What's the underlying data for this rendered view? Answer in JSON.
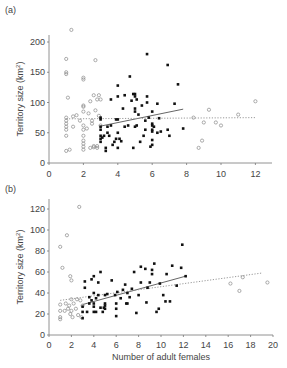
{
  "chart_data": [
    {
      "type": "scatter",
      "panel_label": "(a)",
      "title": "",
      "xlabel": "",
      "ylabel": "Territory size (km²)",
      "xlim": [
        0,
        13
      ],
      "ylim": [
        0,
        230
      ],
      "xticks": [
        0,
        2,
        4,
        6,
        8,
        10,
        12
      ],
      "yticks": [
        0,
        50,
        100,
        150,
        200
      ],
      "grid": false,
      "series": [
        {
          "name": "open circles",
          "marker": "open-circle",
          "points": [
            [
              1,
              20
            ],
            [
              1,
              45
            ],
            [
              1,
              55
            ],
            [
              1,
              60
            ],
            [
              1,
              65
            ],
            [
              1,
              70
            ],
            [
              1,
              75
            ],
            [
              1,
              147
            ],
            [
              1,
              150
            ],
            [
              1,
              172
            ],
            [
              1.1,
              108
            ],
            [
              1.2,
              22
            ],
            [
              1.3,
              220
            ],
            [
              1.4,
              60
            ],
            [
              1.4,
              77
            ],
            [
              1.6,
              79
            ],
            [
              1.8,
              70
            ],
            [
              2,
              22
            ],
            [
              2,
              27
            ],
            [
              2,
              32
            ],
            [
              2,
              37
            ],
            [
              2,
              45
            ],
            [
              2,
              55
            ],
            [
              2,
              62
            ],
            [
              2,
              85
            ],
            [
              2,
              93
            ],
            [
              2,
              95
            ],
            [
              2,
              138
            ],
            [
              2,
              141
            ],
            [
              2.2,
              57
            ],
            [
              2.3,
              82
            ],
            [
              2.4,
              25
            ],
            [
              2.4,
              102
            ],
            [
              2.5,
              65
            ],
            [
              2.5,
              70
            ],
            [
              2.6,
              26
            ],
            [
              2.6,
              28
            ],
            [
              2.6,
              112
            ],
            [
              2.7,
              87
            ],
            [
              2.7,
              170
            ],
            [
              2.8,
              25
            ],
            [
              2.8,
              28
            ],
            [
              2.8,
              105
            ],
            [
              2.9,
              78
            ],
            [
              2.9,
              112
            ],
            [
              3,
              62
            ],
            [
              3,
              105
            ],
            [
              8.4,
              75
            ],
            [
              8.7,
              25
            ],
            [
              8.9,
              37
            ],
            [
              9,
              67
            ],
            [
              9.3,
              88
            ],
            [
              9.7,
              67
            ],
            [
              10,
              62
            ],
            [
              11,
              80
            ],
            [
              12,
              102
            ]
          ]
        },
        {
          "name": "filled circles",
          "marker": "filled-circle",
          "points": [
            [
              3,
              35
            ],
            [
              3,
              40
            ],
            [
              3,
              45
            ],
            [
              3,
              55
            ],
            [
              3,
              60
            ],
            [
              3,
              72
            ],
            [
              3,
              75
            ],
            [
              3.1,
              42
            ],
            [
              3.2,
              45
            ],
            [
              3.3,
              20
            ],
            [
              3.3,
              25
            ],
            [
              3.4,
              50
            ],
            [
              3.4,
              60
            ],
            [
              3.5,
              45
            ],
            [
              3.6,
              105
            ],
            [
              3.6,
              62
            ],
            [
              3.7,
              30
            ],
            [
              3.8,
              35
            ],
            [
              3.9,
              40
            ],
            [
              3.9,
              72
            ],
            [
              4,
              25
            ],
            [
              4,
              110
            ],
            [
              4,
              128
            ],
            [
              4,
              72
            ],
            [
              4,
              50
            ],
            [
              4.1,
              40
            ],
            [
              4.2,
              36
            ],
            [
              4.3,
              90
            ],
            [
              4.4,
              60
            ],
            [
              4.4,
              112
            ],
            [
              4.6,
              62
            ],
            [
              4.7,
              143
            ],
            [
              4.8,
              103
            ],
            [
              4.9,
              25
            ],
            [
              4.9,
              114
            ],
            [
              5,
              60
            ],
            [
              5,
              85
            ],
            [
              5,
              90
            ],
            [
              5,
              110
            ],
            [
              5,
              114
            ],
            [
              5.1,
              62
            ],
            [
              5.1,
              105
            ],
            [
              5.2,
              80
            ],
            [
              5.3,
              35
            ],
            [
              5.4,
              95
            ],
            [
              5.5,
              45
            ],
            [
              5.6,
              70
            ],
            [
              5.6,
              55
            ],
            [
              5.7,
              180
            ],
            [
              5.7,
              100
            ],
            [
              5.7,
              110
            ],
            [
              5.8,
              75
            ],
            [
              5.9,
              27
            ],
            [
              6,
              30
            ],
            [
              6,
              38
            ],
            [
              6,
              52
            ],
            [
              6,
              55
            ],
            [
              6,
              62
            ],
            [
              6,
              65
            ],
            [
              6,
              85
            ],
            [
              6.1,
              60
            ],
            [
              6.3,
              98
            ],
            [
              6.3,
              50
            ],
            [
              6.4,
              74
            ],
            [
              6.5,
              52
            ],
            [
              6.9,
              162
            ],
            [
              6.9,
              55
            ],
            [
              7,
              45
            ],
            [
              7.3,
              98
            ],
            [
              7.5,
              130
            ],
            [
              7.8,
              57
            ]
          ]
        }
      ],
      "fit_lines": [
        {
          "name": "filled fit",
          "style": "solid",
          "x": [
            3,
            7.8
          ],
          "y": [
            61,
            89
          ]
        },
        {
          "name": "open fit",
          "style": "dotted",
          "x": [
            1,
            12
          ],
          "y": [
            73,
            75
          ]
        }
      ]
    },
    {
      "type": "scatter",
      "panel_label": "(b)",
      "title": "",
      "xlabel": "Number of adult females",
      "ylabel": "Territory size (km²)",
      "xlim": [
        0,
        20
      ],
      "ylim": [
        0,
        130
      ],
      "xticks": [
        0,
        2,
        4,
        6,
        8,
        10,
        12,
        14,
        16,
        18,
        20
      ],
      "yticks": [
        0,
        20,
        40,
        60,
        80,
        100,
        120
      ],
      "grid": false,
      "series": [
        {
          "name": "open circles",
          "marker": "open-circle",
          "points": [
            [
              1,
              15
            ],
            [
              1,
              17
            ],
            [
              1,
              23
            ],
            [
              1,
              29
            ],
            [
              1,
              84
            ],
            [
              1.2,
              64
            ],
            [
              1.4,
              23
            ],
            [
              1.5,
              30
            ],
            [
              1.6,
              95
            ],
            [
              1.7,
              25
            ],
            [
              1.8,
              28
            ],
            [
              1.9,
              20
            ],
            [
              1.9,
              56
            ],
            [
              2,
              34
            ],
            [
              2,
              52
            ],
            [
              2,
              23
            ],
            [
              2.1,
              17
            ],
            [
              2.2,
              30
            ],
            [
              2.4,
              25
            ],
            [
              2.5,
              34
            ],
            [
              2.6,
              19
            ],
            [
              2.7,
              122
            ],
            [
              2.8,
              33
            ],
            [
              2.9,
              17
            ],
            [
              3,
              28
            ],
            [
              16.2,
              49
            ],
            [
              17,
              42
            ],
            [
              17.3,
              55
            ],
            [
              19.5,
              50
            ]
          ]
        },
        {
          "name": "filled circles",
          "marker": "filled-circle",
          "points": [
            [
              3,
              16
            ],
            [
              3,
              22
            ],
            [
              3,
              27
            ],
            [
              3.2,
              45
            ],
            [
              3.2,
              51
            ],
            [
              3.4,
              22
            ],
            [
              3.6,
              30
            ],
            [
              3.6,
              36
            ],
            [
              3.8,
              53
            ],
            [
              3.8,
              33
            ],
            [
              4,
              22
            ],
            [
              4,
              27
            ],
            [
              4,
              30
            ],
            [
              4,
              40
            ],
            [
              4,
              56
            ],
            [
              4.2,
              22
            ],
            [
              4.2,
              35
            ],
            [
              4.4,
              38
            ],
            [
              4.4,
              50
            ],
            [
              4.6,
              26
            ],
            [
              4.6,
              60
            ],
            [
              4.8,
              22
            ],
            [
              4.9,
              26
            ],
            [
              5,
              25
            ],
            [
              5,
              28
            ],
            [
              5,
              30
            ],
            [
              5,
              38
            ],
            [
              5.2,
              39
            ],
            [
              5.6,
              52
            ],
            [
              5.9,
              38
            ],
            [
              6,
              18
            ],
            [
              6,
              25
            ],
            [
              6,
              30
            ],
            [
              6.1,
              41
            ],
            [
              6.4,
              35
            ],
            [
              6.6,
              43
            ],
            [
              6.8,
              48
            ],
            [
              6.9,
              30
            ],
            [
              7,
              30
            ],
            [
              7,
              40
            ],
            [
              7.2,
              36
            ],
            [
              7.4,
              44
            ],
            [
              7.6,
              60
            ],
            [
              7.8,
              21
            ],
            [
              8,
              38
            ],
            [
              8.2,
              50
            ],
            [
              8.2,
              65
            ],
            [
              8.6,
              63
            ],
            [
              8.7,
              31
            ],
            [
              8.8,
              45
            ],
            [
              9,
              50
            ],
            [
              9.2,
              58
            ],
            [
              9.2,
              62
            ],
            [
              9.4,
              68
            ],
            [
              9.6,
              22
            ],
            [
              9.8,
              25
            ],
            [
              9.9,
              49
            ],
            [
              10.2,
              38
            ],
            [
              10.4,
              32
            ],
            [
              10.5,
              58
            ],
            [
              10.8,
              32
            ],
            [
              11,
              66
            ],
            [
              11.4,
              47
            ],
            [
              11.8,
              64
            ],
            [
              11.9,
              86
            ],
            [
              12.2,
              56
            ]
          ]
        }
      ],
      "fit_lines": [
        {
          "name": "filled fit",
          "style": "solid",
          "x": [
            3,
            12.2
          ],
          "y": [
            29,
            56
          ]
        },
        {
          "name": "open fit",
          "style": "dotted",
          "x": [
            1,
            19
          ],
          "y": [
            33,
            59
          ]
        }
      ]
    }
  ]
}
